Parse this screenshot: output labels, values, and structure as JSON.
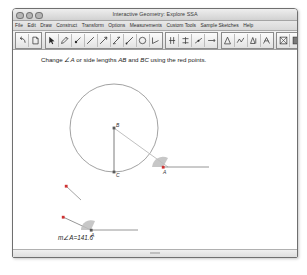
{
  "window": {
    "title": "Interactive Geometry: Explore SSA",
    "traffic_lights": [
      "close",
      "minimize",
      "zoom"
    ]
  },
  "menubar": {
    "items": [
      {
        "label": "File"
      },
      {
        "label": "Edit"
      },
      {
        "label": "Draw"
      },
      {
        "label": "Construct"
      },
      {
        "label": "Transform"
      },
      {
        "label": "Options"
      },
      {
        "label": "Measurements"
      },
      {
        "label": "Custom Tools"
      },
      {
        "label": "Sample Sketches"
      },
      {
        "label": "Help"
      }
    ]
  },
  "toolbar": {
    "groups": [
      {
        "name": "history",
        "buttons": [
          {
            "icon": "undo-arrow-icon"
          },
          {
            "icon": "redo-page-icon"
          }
        ]
      },
      {
        "name": "drawing",
        "buttons": [
          {
            "icon": "arrow-select-icon"
          },
          {
            "icon": "pencil-icon"
          },
          {
            "icon": "point-marker-icon"
          },
          {
            "icon": "segment-icon"
          },
          {
            "icon": "ray-icon"
          },
          {
            "icon": "line-icon"
          },
          {
            "icon": "vector-icon"
          },
          {
            "icon": "circle-icon"
          },
          {
            "icon": "angle-icon"
          }
        ]
      },
      {
        "name": "construct",
        "buttons": [
          {
            "icon": "parallel-icon"
          },
          {
            "icon": "perpendicular-icon"
          },
          {
            "icon": "midpoint-icon"
          },
          {
            "icon": "bisector-icon"
          }
        ]
      },
      {
        "name": "transform",
        "buttons": [
          {
            "icon": "reflect-icon"
          },
          {
            "icon": "rotate-icon"
          },
          {
            "icon": "translate-icon"
          },
          {
            "icon": "dilate-icon"
          }
        ]
      },
      {
        "name": "display",
        "buttons": [
          {
            "icon": "hide-show-icon"
          },
          {
            "icon": "grid-icon"
          }
        ]
      }
    ]
  },
  "canvas": {
    "instruction": {
      "prefix": "Change ",
      "angle": "∠A",
      "middle": " or side lengths ",
      "side1": "AB",
      "conjunction": " and ",
      "side2": "BC",
      "suffix": " using the red points."
    },
    "construction": {
      "circle": {
        "center_label": "B",
        "center_x": 101,
        "center_y": 78,
        "radius": 44
      },
      "points": [
        {
          "label": "B",
          "x": 101,
          "y": 78,
          "color": "#5a5a5a"
        },
        {
          "label": "C",
          "x": 101,
          "y": 122,
          "color": "#5a5a5a"
        },
        {
          "label": "A",
          "x": 152,
          "y": 116,
          "color": "#cf3232"
        },
        {
          "label": "",
          "x": 53,
          "y": 135,
          "color": "#cf3232"
        }
      ]
    },
    "measurements": [
      {
        "name": "angle-a",
        "label": "m∠A",
        "operator": "=",
        "value": "141.6"
      },
      {
        "name": "side-ab",
        "label": "AB",
        "operator": "=",
        "value": "18"
      },
      {
        "name": "side-bc",
        "label": "BC",
        "operator": "=",
        "value": "12"
      }
    ],
    "slider_labels": {
      "angle_vertex": "A",
      "ab_left": "A",
      "ab_right": "B",
      "bc_left": "B",
      "bc_right": "C"
    }
  },
  "colors": {
    "red_point": "#cf3232",
    "gray_point": "#5a5a5a",
    "line": "#8a8a8a",
    "angle_arc": "#a9a9a9"
  }
}
